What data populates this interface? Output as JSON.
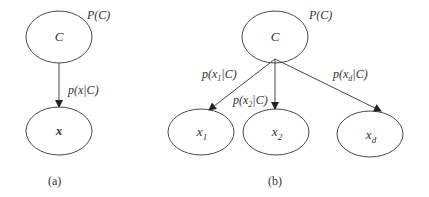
{
  "diagram_a": {
    "caption": "(a)",
    "prior_label": "P(C)",
    "edge_label": "p(x|C)",
    "nodes": {
      "class": "C",
      "features": "x"
    }
  },
  "diagram_b": {
    "caption": "(b)",
    "prior_label": "P(C)",
    "nodes": {
      "class": "C",
      "x1": "x",
      "x1_sub": "1",
      "x2": "x",
      "x2_sub": "2",
      "xd": "x",
      "xd_sub": "d"
    },
    "edges": [
      {
        "pre": "p(x",
        "sub": "1",
        "post": "|C)"
      },
      {
        "pre": "p(x",
        "sub": "2",
        "post": "|C)"
      },
      {
        "pre": "p(x",
        "sub": "d",
        "post": "|C)"
      }
    ]
  }
}
